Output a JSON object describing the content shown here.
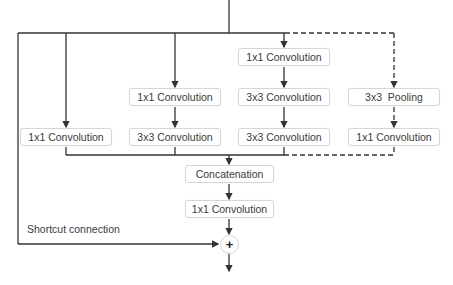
{
  "diagram": {
    "colors": {
      "line": "#333333",
      "box_border": "#d6d6d6",
      "text": "#3a3a3a"
    },
    "branches": [
      {
        "id": "b1",
        "nodes": [
          "1x1 Convolution"
        ]
      },
      {
        "id": "b2",
        "nodes": [
          "1x1 Convolution",
          "3x3 Convolution"
        ]
      },
      {
        "id": "b3",
        "nodes": [
          "1x1 Convolution",
          "3x3 Convolution",
          "3x3 Convolution"
        ]
      },
      {
        "id": "b4",
        "style": "dashed",
        "nodes": [
          "3x3  Pooling",
          "1x1 Convolution"
        ]
      }
    ],
    "concat_label": "Concatenation",
    "post_conv_label": "1x1 Convolution",
    "shortcut_label": "Shortcut connection",
    "add_symbol": "+"
  }
}
